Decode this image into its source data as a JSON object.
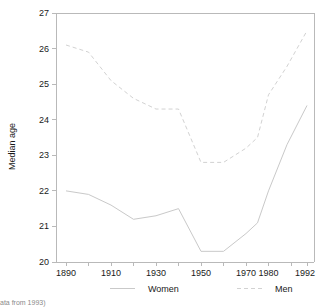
{
  "chart_data": {
    "type": "line",
    "title": "",
    "subtitle": "",
    "xlabel": "",
    "ylabel": "Median age",
    "ylim": [
      20,
      27
    ],
    "xlim": [
      1890,
      1992
    ],
    "grid": false,
    "legend_position": "bottom",
    "x_tick_labels": [
      "1890",
      "1910",
      "1930",
      "1950",
      "1970",
      "1980",
      "1992"
    ],
    "x_tick_values": [
      1890,
      1910,
      1930,
      1950,
      1970,
      1980,
      1992
    ],
    "x_minor_ticks": [
      1900,
      1920,
      1940,
      1960,
      1975,
      1985
    ],
    "y_tick_labels": [
      "20",
      "21",
      "22",
      "23",
      "24",
      "25",
      "26",
      "27"
    ],
    "y_tick_values": [
      20,
      21,
      22,
      23,
      24,
      25,
      26,
      27
    ],
    "x": [
      1890,
      1900,
      1910,
      1920,
      1930,
      1940,
      1950,
      1960,
      1970,
      1975,
      1980,
      1985,
      1992
    ],
    "series": [
      {
        "name": "Women",
        "style": "solid",
        "color": "#c9c9c9",
        "values": [
          22.0,
          21.9,
          21.6,
          21.2,
          21.3,
          21.5,
          20.3,
          20.3,
          20.8,
          21.1,
          22.0,
          23.3,
          24.4
        ]
      },
      {
        "name": "Men",
        "style": "dashed",
        "color": "#d2d2d2",
        "values": [
          26.1,
          25.9,
          25.1,
          24.6,
          24.3,
          24.3,
          22.8,
          22.8,
          23.2,
          23.5,
          24.7,
          25.5,
          26.5
        ]
      }
    ]
  },
  "legend": {
    "items": [
      {
        "label": "Women",
        "style": "solid"
      },
      {
        "label": "Men",
        "style": "dashed"
      }
    ]
  },
  "footnote": {
    "text": "ata from 1993)"
  },
  "colors": {
    "women_line": "#c9c9c9",
    "men_line": "#d2d2d2",
    "frame": "#b9b9b9",
    "text": "#1a1a1a",
    "background": "#ffffff"
  }
}
